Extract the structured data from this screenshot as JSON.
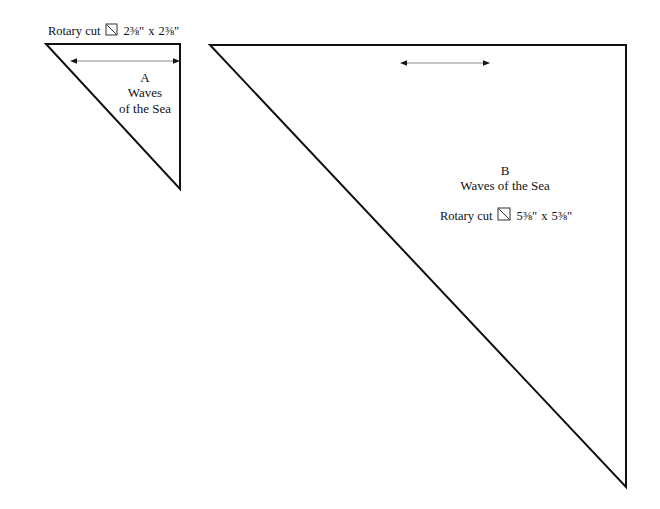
{
  "page": {
    "background_color": "#ffffff",
    "line_color": "#111111",
    "arrow_shaft_color": "#8a8a8a",
    "width": 660,
    "height": 509
  },
  "patches": [
    {
      "id": "A",
      "letter": "A",
      "pattern_name_line1": "Waves",
      "pattern_name_line2": "of the Sea",
      "pattern_name_full": "Waves of the Sea",
      "cut_prefix": "Rotary cut",
      "cut_icon": "square-with-diagonal-icon",
      "cut_size_width": "2⅜\"",
      "cut_size_height": "2⅜\"",
      "cut_size_separator": "x",
      "cut_instruction": "Rotary cut 2⅜\" x 2⅜\"",
      "shape": "right-triangle",
      "right_angle_corner": "top-right",
      "vertices": [
        [
          46,
          44
        ],
        [
          180,
          44
        ],
        [
          180,
          189
        ]
      ],
      "grain_arrow": {
        "type": "double-headed-horizontal-arrow",
        "x1": 76,
        "x2": 174,
        "y": 61
      }
    },
    {
      "id": "B",
      "letter": "B",
      "pattern_name_line1": "Waves of the Sea",
      "pattern_name_line2": "",
      "pattern_name_full": "Waves of the Sea",
      "cut_prefix": "Rotary cut",
      "cut_icon": "square-with-diagonal-icon",
      "cut_size_width": "5⅜\"",
      "cut_size_height": "5⅜\"",
      "cut_size_separator": "x",
      "cut_instruction": "Rotary cut 5⅜\" x 5⅜\"",
      "shape": "right-triangle",
      "right_angle_corner": "top-right",
      "vertices": [
        [
          210,
          45
        ],
        [
          626,
          45
        ],
        [
          626,
          487
        ]
      ],
      "grain_arrow": {
        "type": "double-headed-horizontal-arrow",
        "x1": 406,
        "x2": 484,
        "y": 63
      }
    }
  ]
}
